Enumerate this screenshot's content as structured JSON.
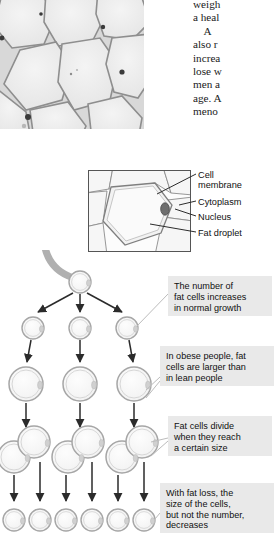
{
  "figure": {
    "micrograph": {
      "name": "adipose-tissue-micrograph",
      "caption": ""
    },
    "body_text": {
      "lines": [
        "weigh",
        "a heal",
        "    A",
        "also r",
        "increa",
        "lose w",
        "men a",
        "age. A",
        "meno"
      ]
    },
    "cell_diagram": {
      "labels": [
        {
          "id": "cell-membrane",
          "text": "Cell\nmembrane"
        },
        {
          "id": "cytoplasm",
          "text": "Cytoplasm"
        },
        {
          "id": "nucleus",
          "text": "Nucleus"
        },
        {
          "id": "fat-droplet",
          "text": "Fat droplet"
        }
      ]
    },
    "notes": [
      {
        "id": "note-growth",
        "text": "The number of\nfat cells increases\nin normal growth"
      },
      {
        "id": "note-obese",
        "text": "In obese people, fat\ncells are larger than\nin lean people"
      },
      {
        "id": "note-divide",
        "text": "Fat cells divide\nwhen they reach\na certain size"
      },
      {
        "id": "note-fat-loss",
        "text": "With fat loss, the\nsize of the cells,\nbut not the number,\ndecreases"
      }
    ],
    "tree": {
      "rows": [
        {
          "id": "row-single",
          "cell_count": 1,
          "size": "small"
        },
        {
          "id": "row-three",
          "cell_count": 3,
          "size": "small"
        },
        {
          "id": "row-enlarged",
          "cell_count": 3,
          "size": "large"
        },
        {
          "id": "row-dividing",
          "cell_count": 3,
          "size": "dividing"
        },
        {
          "id": "row-shrunken",
          "cell_count": 6,
          "size": "tiny"
        }
      ]
    },
    "colors": {
      "note_background": "#e9e9e9",
      "cell_outline": "#9a9a9a",
      "arrow": "#2b2b2b",
      "leader": "#b4b4b4",
      "curved_arrow": "#a8a8a8",
      "text": "#101010"
    }
  }
}
